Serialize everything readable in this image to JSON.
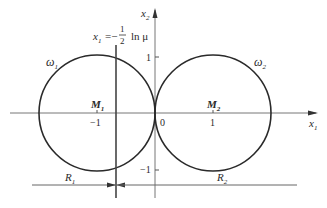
{
  "diagram": {
    "axes": {
      "x_label": "x",
      "x_label_sub": "1",
      "y_label": "x",
      "y_label_sub": "2",
      "origin_label": "0",
      "ticks": {
        "x_neg1": "−1",
        "x_pos1": "1",
        "y_pos1": "1",
        "y_neg1": "−1"
      }
    },
    "circles": [
      {
        "name": "omega-1",
        "label": "ω",
        "label_sub": "1",
        "center_label": "M",
        "center_sub": "1",
        "center": [
          -1,
          0
        ],
        "radius": 1
      },
      {
        "name": "omega-2",
        "label": "ω",
        "label_sub": "2",
        "center_label": "M",
        "center_sub": "2",
        "center": [
          1,
          0
        ],
        "radius": 1
      }
    ],
    "vertical_line": {
      "eq_lhs": "x",
      "eq_lhs_sub": "1",
      "eq_mid": "=−",
      "frac_num": "1",
      "frac_den": "2",
      "eq_rhs": "ln μ",
      "x_value": -0.33
    },
    "dimensions": {
      "r1_label": "R",
      "r1_sub": "1",
      "r2_label": "R",
      "r2_sub": "2"
    },
    "colors": {
      "curve": "#2a2a2a",
      "axis": "#555555",
      "text": "#2a2a2a"
    }
  }
}
